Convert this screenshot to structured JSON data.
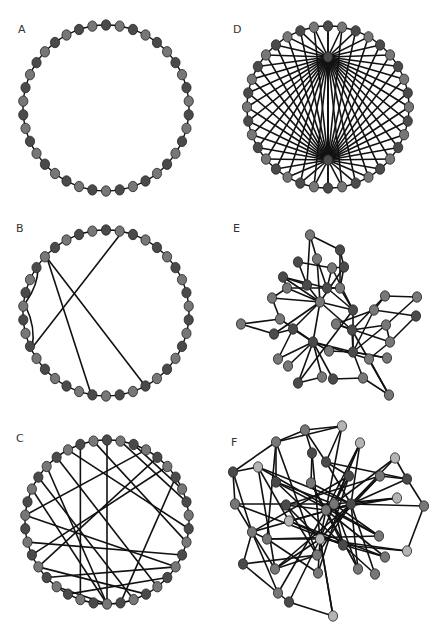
{
  "figure": {
    "width": 443,
    "height": 631,
    "colors": {
      "background": "#ffffff",
      "edge": "#111111",
      "node_dark": "#4a4a4a",
      "node_mid": "#777777",
      "node_light": "#b4b4b4",
      "node_stroke": "#222222",
      "label": "#333333"
    },
    "node_rx": 4.6,
    "node_ry": 5.2
  },
  "panels": [
    {
      "id": "A",
      "label": "A",
      "label_pos": [
        18,
        33
      ],
      "type": "ring",
      "center": [
        106,
        108
      ],
      "radius": 83,
      "n_nodes": 38,
      "ring_edges": true,
      "chords": []
    },
    {
      "id": "B",
      "label": "B",
      "label_pos": [
        16,
        232
      ],
      "type": "ring",
      "center": [
        106,
        313
      ],
      "radius": 83,
      "n_nodes": 38,
      "ring_edges": true,
      "chords_xy": [
        [
          [
            47,
            258
          ],
          [
            92,
            397
          ]
        ],
        [
          [
            47,
            258
          ],
          [
            146,
            387
          ]
        ],
        [
          [
            119,
            236
          ],
          [
            32,
            348
          ]
        ]
      ],
      "arcs_xy": [
        [
          [
            38,
            268
          ],
          [
            26,
            302
          ],
          6
        ],
        [
          [
            26,
            307
          ],
          [
            32,
            348
          ],
          7
        ]
      ]
    },
    {
      "id": "C",
      "label": "C",
      "label_pos": [
        16,
        442
      ],
      "type": "ring",
      "center": [
        107,
        522
      ],
      "radius": 82,
      "n_nodes": 38,
      "ring_edges": true,
      "chords": [
        [
          0,
          19
        ],
        [
          1,
          8
        ],
        [
          2,
          7
        ],
        [
          35,
          10
        ],
        [
          36,
          21
        ],
        [
          33,
          19
        ],
        [
          32,
          17
        ],
        [
          31,
          19
        ],
        [
          5,
          26
        ],
        [
          4,
          25
        ],
        [
          27,
          12
        ],
        [
          29,
          13
        ],
        [
          25,
          16
        ],
        [
          24,
          13
        ],
        [
          23,
          19
        ],
        [
          22,
          14
        ],
        [
          37,
          11
        ],
        [
          6,
          18
        ],
        [
          3,
          29
        ],
        [
          34,
          15
        ]
      ]
    },
    {
      "id": "D",
      "label": "D",
      "label_pos": [
        233,
        33
      ],
      "type": "ring",
      "center": [
        328,
        107
      ],
      "radius": 81,
      "n_nodes": 36,
      "ring_edges": true,
      "hubs": [
        [
          328,
          57
        ],
        [
          328,
          160
        ]
      ],
      "hub_node_color": "dark"
    },
    {
      "id": "E",
      "label": "E",
      "label_pos": [
        233,
        232
      ],
      "type": "free",
      "nodes": [
        [
          310,
          235,
          "m"
        ],
        [
          340,
          250,
          "d"
        ],
        [
          298,
          262,
          "d"
        ],
        [
          317,
          259,
          "m"
        ],
        [
          332,
          268,
          "m"
        ],
        [
          344,
          267,
          "d"
        ],
        [
          283,
          277,
          "d"
        ],
        [
          287,
          288,
          "m"
        ],
        [
          307,
          285,
          "d"
        ],
        [
          327,
          288,
          "d"
        ],
        [
          340,
          288,
          "m"
        ],
        [
          272,
          298,
          "m"
        ],
        [
          320,
          302,
          "m"
        ],
        [
          385,
          296,
          "m"
        ],
        [
          417,
          297,
          "m"
        ],
        [
          353,
          310,
          "d"
        ],
        [
          374,
          310,
          "m"
        ],
        [
          241,
          324,
          "m"
        ],
        [
          280,
          319,
          "m"
        ],
        [
          274,
          334,
          "d"
        ],
        [
          293,
          329,
          "d"
        ],
        [
          336,
          324,
          "m"
        ],
        [
          352,
          330,
          "d"
        ],
        [
          386,
          325,
          "m"
        ],
        [
          416,
          316,
          "d"
        ],
        [
          313,
          342,
          "d"
        ],
        [
          390,
          342,
          "m"
        ],
        [
          329,
          351,
          "m"
        ],
        [
          353,
          352,
          "d"
        ],
        [
          278,
          359,
          "m"
        ],
        [
          288,
          366,
          "m"
        ],
        [
          369,
          359,
          "m"
        ],
        [
          387,
          358,
          "m"
        ],
        [
          298,
          383,
          "d"
        ],
        [
          322,
          377,
          "m"
        ],
        [
          333,
          379,
          "d"
        ],
        [
          363,
          378,
          "m"
        ],
        [
          389,
          395,
          "m"
        ]
      ],
      "edges": [
        [
          0,
          1
        ],
        [
          0,
          3
        ],
        [
          0,
          8
        ],
        [
          1,
          5
        ],
        [
          1,
          10
        ],
        [
          2,
          8
        ],
        [
          2,
          4
        ],
        [
          3,
          9
        ],
        [
          3,
          12
        ],
        [
          4,
          5
        ],
        [
          4,
          9
        ],
        [
          5,
          10
        ],
        [
          5,
          12
        ],
        [
          6,
          8
        ],
        [
          6,
          9
        ],
        [
          6,
          7
        ],
        [
          7,
          10
        ],
        [
          7,
          12
        ],
        [
          8,
          12
        ],
        [
          9,
          10
        ],
        [
          9,
          15
        ],
        [
          10,
          15
        ],
        [
          11,
          18
        ],
        [
          11,
          12
        ],
        [
          12,
          19
        ],
        [
          12,
          25
        ],
        [
          12,
          22
        ],
        [
          12,
          15
        ],
        [
          13,
          14
        ],
        [
          13,
          16
        ],
        [
          13,
          22
        ],
        [
          14,
          23
        ],
        [
          24,
          16
        ],
        [
          15,
          28
        ],
        [
          16,
          21
        ],
        [
          16,
          28
        ],
        [
          17,
          18
        ],
        [
          17,
          19
        ],
        [
          18,
          25
        ],
        [
          19,
          20
        ],
        [
          20,
          25
        ],
        [
          20,
          29
        ],
        [
          20,
          12
        ],
        [
          21,
          22
        ],
        [
          21,
          26
        ],
        [
          22,
          23
        ],
        [
          22,
          28
        ],
        [
          23,
          26
        ],
        [
          25,
          27
        ],
        [
          25,
          28
        ],
        [
          25,
          29
        ],
        [
          25,
          30
        ],
        [
          25,
          33
        ],
        [
          25,
          34
        ],
        [
          25,
          35
        ],
        [
          25,
          31
        ],
        [
          26,
          31
        ],
        [
          27,
          28
        ],
        [
          28,
          32
        ],
        [
          28,
          36
        ],
        [
          31,
          37
        ],
        [
          32,
          28
        ],
        [
          33,
          34
        ],
        [
          35,
          36
        ],
        [
          36,
          37
        ],
        [
          23,
          28
        ],
        [
          24,
          26
        ],
        [
          11,
          7
        ],
        [
          15,
          33
        ],
        [
          4,
          15
        ],
        [
          22,
          37
        ],
        [
          6,
          12
        ]
      ]
    },
    {
      "id": "F",
      "label": "F",
      "label_pos": [
        231,
        446
      ],
      "type": "free",
      "nodes": [
        [
          305,
          430,
          "m"
        ],
        [
          342,
          426,
          "l"
        ],
        [
          276,
          442,
          "m"
        ],
        [
          360,
          443,
          "l"
        ],
        [
          312,
          453,
          "d"
        ],
        [
          326,
          462,
          "d"
        ],
        [
          233,
          472,
          "d"
        ],
        [
          258,
          467,
          "l"
        ],
        [
          395,
          458,
          "l"
        ],
        [
          276,
          482,
          "d"
        ],
        [
          311,
          483,
          "m"
        ],
        [
          349,
          476,
          "d"
        ],
        [
          380,
          476,
          "m"
        ],
        [
          407,
          479,
          "d"
        ],
        [
          235,
          504,
          "m"
        ],
        [
          286,
          505,
          "d"
        ],
        [
          326,
          510,
          "m"
        ],
        [
          334,
          504,
          "m"
        ],
        [
          351,
          504,
          "d"
        ],
        [
          397,
          498,
          "l"
        ],
        [
          424,
          506,
          "m"
        ],
        [
          289,
          521,
          "l"
        ],
        [
          252,
          532,
          "m"
        ],
        [
          267,
          539,
          "m"
        ],
        [
          320,
          539,
          "l"
        ],
        [
          343,
          545,
          "d"
        ],
        [
          379,
          536,
          "m"
        ],
        [
          407,
          551,
          "l"
        ],
        [
          317,
          555,
          "m"
        ],
        [
          385,
          557,
          "m"
        ],
        [
          243,
          564,
          "d"
        ],
        [
          275,
          569,
          "m"
        ],
        [
          318,
          573,
          "m"
        ],
        [
          358,
          569,
          "m"
        ],
        [
          375,
          574,
          "m"
        ],
        [
          278,
          593,
          "m"
        ],
        [
          289,
          602,
          "d"
        ],
        [
          333,
          616,
          "l"
        ]
      ],
      "edges": [
        [
          0,
          1
        ],
        [
          0,
          2
        ],
        [
          0,
          4
        ],
        [
          0,
          5
        ],
        [
          1,
          2
        ],
        [
          1,
          5
        ],
        [
          1,
          16
        ],
        [
          2,
          6
        ],
        [
          2,
          9
        ],
        [
          2,
          23
        ],
        [
          3,
          17
        ],
        [
          3,
          18
        ],
        [
          3,
          24
        ],
        [
          4,
          10
        ],
        [
          4,
          24
        ],
        [
          5,
          11
        ],
        [
          5,
          13
        ],
        [
          5,
          18
        ],
        [
          6,
          7
        ],
        [
          6,
          14
        ],
        [
          6,
          22
        ],
        [
          7,
          21
        ],
        [
          7,
          18
        ],
        [
          7,
          31
        ],
        [
          8,
          13
        ],
        [
          8,
          18
        ],
        [
          8,
          16
        ],
        [
          9,
          17
        ],
        [
          9,
          26
        ],
        [
          10,
          25
        ],
        [
          10,
          18
        ],
        [
          11,
          17
        ],
        [
          11,
          32
        ],
        [
          12,
          13
        ],
        [
          12,
          15
        ],
        [
          12,
          18
        ],
        [
          13,
          20
        ],
        [
          13,
          18
        ],
        [
          14,
          17
        ],
        [
          14,
          22
        ],
        [
          15,
          16
        ],
        [
          15,
          24
        ],
        [
          15,
          28
        ],
        [
          16,
          19
        ],
        [
          16,
          24
        ],
        [
          17,
          25
        ],
        [
          18,
          19
        ],
        [
          18,
          20
        ],
        [
          18,
          21
        ],
        [
          18,
          22
        ],
        [
          18,
          24
        ],
        [
          18,
          28
        ],
        [
          18,
          31
        ],
        [
          18,
          33
        ],
        [
          18,
          34
        ],
        [
          19,
          17
        ],
        [
          20,
          27
        ],
        [
          21,
          25
        ],
        [
          21,
          29
        ],
        [
          22,
          23
        ],
        [
          22,
          30
        ],
        [
          22,
          35
        ],
        [
          23,
          26
        ],
        [
          23,
          24
        ],
        [
          24,
          27
        ],
        [
          24,
          36
        ],
        [
          24,
          32
        ],
        [
          24,
          37
        ],
        [
          25,
          27
        ],
        [
          25,
          29
        ],
        [
          26,
          17
        ],
        [
          28,
          31
        ],
        [
          28,
          30
        ],
        [
          29,
          16
        ],
        [
          30,
          35
        ],
        [
          31,
          24
        ],
        [
          32,
          23
        ],
        [
          33,
          17
        ],
        [
          34,
          25
        ],
        [
          35,
          36
        ],
        [
          35,
          16
        ],
        [
          36,
          37
        ],
        [
          37,
          24
        ],
        [
          9,
          25
        ],
        [
          10,
          33
        ],
        [
          11,
          22
        ],
        [
          12,
          24
        ],
        [
          14,
          25
        ],
        [
          3,
          16
        ],
        [
          7,
          26
        ],
        [
          2,
          28
        ],
        [
          31,
          22
        ]
      ]
    }
  ],
  "chart_data": {
    "type": "network-diagram",
    "title": "",
    "panels": [
      {
        "label": "A",
        "layout": "circular",
        "nodes": 38,
        "description": "Regular ring lattice, each node connected to its two neighbours only"
      },
      {
        "label": "B",
        "layout": "circular",
        "nodes": 38,
        "description": "Ring lattice with a few (about 5) rewired long-range shortcuts"
      },
      {
        "label": "C",
        "layout": "circular",
        "nodes": 38,
        "description": "Ring with many (about 20) random long-range chords"
      },
      {
        "label": "D",
        "layout": "circular",
        "nodes": 38,
        "description": "Ring with two central hub nodes each connected to all ring nodes"
      },
      {
        "label": "E",
        "layout": "force-directed",
        "nodes": 38,
        "description": "Sparse irregular network with a few hubs"
      },
      {
        "label": "F",
        "layout": "force-directed",
        "nodes": 38,
        "description": "Dense irregular network with multiple high-degree hubs"
      }
    ]
  }
}
